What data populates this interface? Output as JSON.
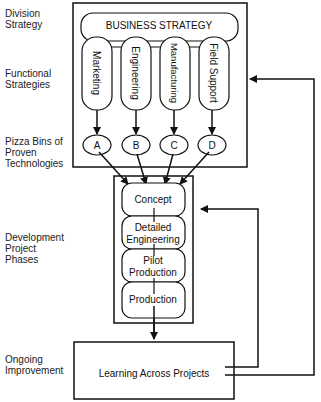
{
  "row_labels": {
    "division": [
      "Division",
      "Strategy"
    ],
    "functional": [
      "Functional",
      "Strategies"
    ],
    "pizza": [
      "Pizza Bins of",
      "Proven",
      "Technologies"
    ],
    "development": [
      "Development",
      "Project",
      "Phases"
    ],
    "ongoing": [
      "Ongoing",
      "Improvement"
    ]
  },
  "business_strategy": "BUSINESS STRATEGY",
  "functions": [
    "Marketing",
    "Engineering",
    "Manufacturing",
    "Field Support"
  ],
  "bins": [
    "A",
    "B",
    "C",
    "D"
  ],
  "phases": {
    "concept": "Concept",
    "detailed_1": "Detailed",
    "detailed_2": "Engineering",
    "pilot_1": "Pilot",
    "pilot_2": "Production",
    "production": "Production"
  },
  "learning": "Learning Across Projects"
}
